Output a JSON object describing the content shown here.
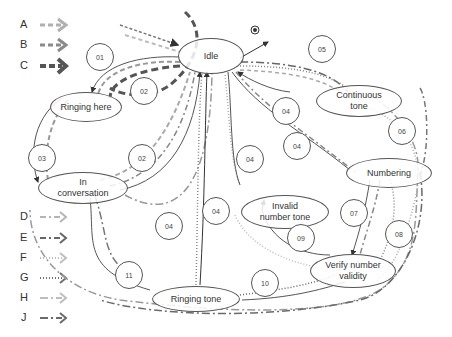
{
  "legend": [
    {
      "key": "A",
      "style": "dashed-light",
      "color": "#b0b0b0"
    },
    {
      "key": "B",
      "style": "dashed-medium",
      "color": "#8a8a8a"
    },
    {
      "key": "C",
      "style": "dashed-heavy",
      "color": "#555555"
    },
    {
      "key": "D",
      "style": "dash-dot-light",
      "color": "#b5b5b5"
    },
    {
      "key": "E",
      "style": "dash-dot-dark",
      "color": "#666666"
    },
    {
      "key": "F",
      "style": "dotted-light",
      "color": "#bdbdbd"
    },
    {
      "key": "G",
      "style": "dotted-dark",
      "color": "#707070"
    },
    {
      "key": "H",
      "style": "long-dash-dot-light",
      "color": "#bdbdbd"
    },
    {
      "key": "J",
      "style": "long-dash-dot-dark",
      "color": "#6a6a6a"
    }
  ],
  "states": {
    "idle": "Idle",
    "ringing_here": "Ringing here",
    "in_conversation_1": "In",
    "in_conversation_2": "conversation",
    "continuous_tone_1": "Continuous",
    "continuous_tone_2": "tone",
    "numbering": "Numbering",
    "invalid_tone_1": "Invalid",
    "invalid_tone_2": "number tone",
    "verify_1": "Verify number",
    "verify_2": "validity",
    "ringing_tone": "Ringing tone"
  },
  "transitions": [
    {
      "id": "01",
      "x": 99,
      "y": 56
    },
    {
      "id": "02",
      "x": 143,
      "y": 90
    },
    {
      "id": "02",
      "x": 141,
      "y": 157
    },
    {
      "id": "03",
      "x": 41,
      "y": 157
    },
    {
      "id": "04",
      "x": 168,
      "y": 225
    },
    {
      "id": "04",
      "x": 215,
      "y": 210
    },
    {
      "id": "04",
      "x": 249,
      "y": 158
    },
    {
      "id": "04",
      "x": 296,
      "y": 145
    },
    {
      "id": "04",
      "x": 285,
      "y": 110
    },
    {
      "id": "05",
      "x": 321,
      "y": 48
    },
    {
      "id": "06",
      "x": 401,
      "y": 130
    },
    {
      "id": "07",
      "x": 353,
      "y": 212
    },
    {
      "id": "08",
      "x": 398,
      "y": 233
    },
    {
      "id": "09",
      "x": 300,
      "y": 237
    },
    {
      "id": "10",
      "x": 264,
      "y": 282
    },
    {
      "id": "11",
      "x": 128,
      "y": 274
    }
  ]
}
